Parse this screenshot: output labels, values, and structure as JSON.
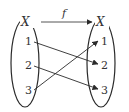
{
  "diagram": {
    "colors": {
      "ink": "#2a2a2a",
      "text": "#333333",
      "background": "#ffffff"
    },
    "domain_set": {
      "label": "X",
      "elements": [
        "1",
        "2",
        "3"
      ]
    },
    "codomain_set": {
      "label": "X",
      "elements": [
        "1",
        "2",
        "3"
      ]
    },
    "function": {
      "label": "f",
      "from": "X",
      "to": "X"
    },
    "mappings": [
      {
        "from": "1",
        "to": "2"
      },
      {
        "from": "2",
        "to": "3"
      },
      {
        "from": "3",
        "to": "1"
      }
    ]
  }
}
